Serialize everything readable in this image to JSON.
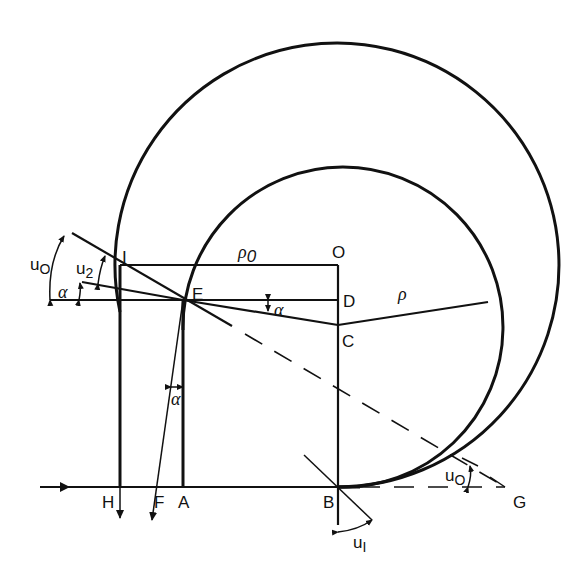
{
  "figure": {
    "points": {
      "O": "O",
      "D": "D",
      "C": "C",
      "E": "E",
      "I": "I",
      "H": "H",
      "F": "F",
      "A": "A",
      "B": "B",
      "G": "G"
    },
    "radii": {
      "outer": "ρ",
      "outer_sub": "0",
      "inner": "ρ"
    },
    "angles": {
      "u0_left": "u",
      "u0_left_sub": "O",
      "u2": "u",
      "u2_sub": "2",
      "alpha_left": "α",
      "alpha_ED": "α",
      "alpha_vertical": "α",
      "u0_right": "u",
      "u0_right_sub": "O",
      "u1": "u",
      "u1_sub": "I"
    },
    "colors": {
      "ink": "#111111",
      "background": "#ffffff"
    }
  }
}
